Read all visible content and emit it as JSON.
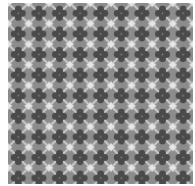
{
  "image": {
    "description": "Grayscale repeating textile/tile pattern of dark four-lobed cross shapes alternating with light star shapes on a diagonal lattice",
    "width": 195,
    "height": 186,
    "pattern": {
      "tile_size": 20.6,
      "repeats_x": 9,
      "repeats_y": 9,
      "colors": {
        "dark_cross": "#4a4a4a",
        "mid_background": "#8c8c8c",
        "light_star": "#e6e6e6",
        "lattice_line": "#c8c8c8",
        "margin": "#ffffff"
      }
    }
  }
}
